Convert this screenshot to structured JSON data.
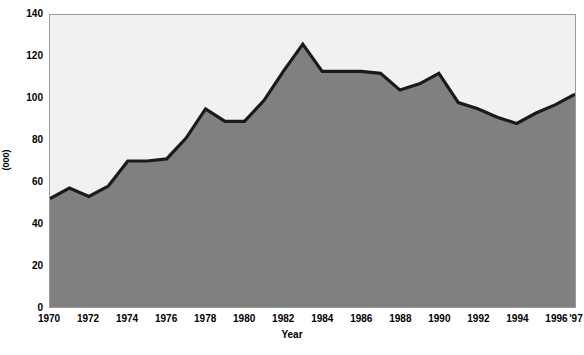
{
  "chart_data": {
    "type": "area",
    "title": "",
    "xlabel": "Year",
    "ylabel": "(000)",
    "x": [
      1970,
      1971,
      1972,
      1973,
      1974,
      1975,
      1976,
      1977,
      1978,
      1979,
      1980,
      1981,
      1982,
      1983,
      1984,
      1985,
      1986,
      1987,
      1988,
      1989,
      1990,
      1991,
      1992,
      1993,
      1994,
      1995,
      1996,
      1997
    ],
    "values": [
      52,
      57,
      53,
      58,
      70,
      70,
      71,
      81,
      95,
      89,
      89,
      99,
      113,
      126,
      113,
      113,
      113,
      112,
      104,
      107,
      112,
      98,
      95,
      91,
      88,
      93,
      97,
      102
    ],
    "series": [
      {
        "name": "",
        "values": [
          52,
          57,
          53,
          58,
          70,
          70,
          71,
          81,
          95,
          89,
          89,
          99,
          113,
          126,
          113,
          113,
          113,
          112,
          104,
          107,
          112,
          98,
          95,
          91,
          88,
          93,
          97,
          102
        ]
      }
    ],
    "xlim": [
      1970,
      1997
    ],
    "ylim": [
      0,
      140
    ],
    "ytick_values": [
      0,
      20,
      40,
      60,
      80,
      100,
      120,
      140
    ],
    "ytick_labels": [
      "0",
      "20",
      "40",
      "60",
      "80",
      "100",
      "120",
      "140"
    ],
    "xtick_values": [
      1970,
      1972,
      1974,
      1976,
      1978,
      1980,
      1982,
      1984,
      1986,
      1988,
      1990,
      1992,
      1994,
      1996,
      1997
    ],
    "xtick_labels": [
      "1970",
      "1972",
      "1974",
      "1976",
      "1978",
      "1980",
      "1982",
      "1984",
      "1986",
      "1988",
      "1990",
      "1992",
      "1994",
      "1996",
      "'97"
    ],
    "grid": false,
    "legend": null,
    "legend_position": "none",
    "annotations": [],
    "colors": {
      "area_fill": "#808080",
      "line": "#1a1a1a",
      "plot_background": "#f1f1f1",
      "axis_text": "#000000",
      "plot_border": "#9a9a9a",
      "figure_background": "#ffffff"
    }
  }
}
